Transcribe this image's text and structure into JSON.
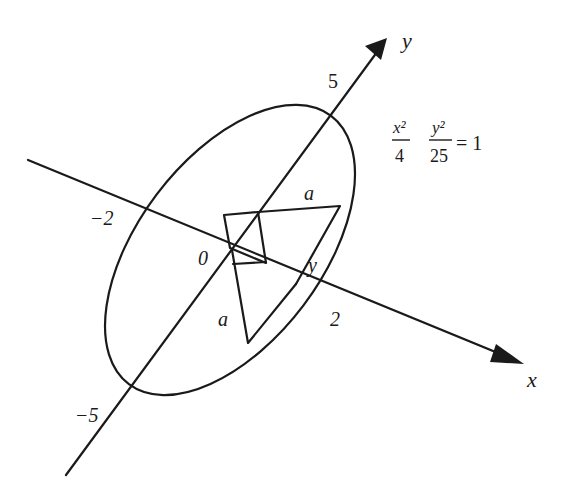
{
  "diagram": {
    "type": "geometry",
    "axes": {
      "x_label": "x",
      "y_label": "y"
    },
    "tick_labels": {
      "y_pos": "5",
      "y_neg": "−5",
      "x_pos": "2",
      "x_neg": "−2",
      "origin": "0"
    },
    "equation": {
      "term1_num": "x²",
      "term1_den": "4",
      "term2_num": "y²",
      "term2_den": "25",
      "rhs": "= 1"
    },
    "segment_labels": {
      "upper_a": "a",
      "lower_a": "a",
      "y_side": "y"
    },
    "colors": {
      "ink": "#1a1a1a",
      "background": "#ffffff"
    }
  }
}
